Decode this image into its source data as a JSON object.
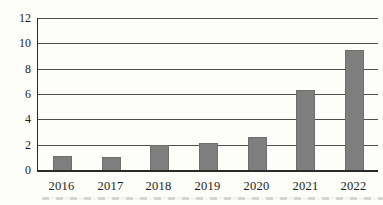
{
  "chart_data": {
    "type": "bar",
    "title": "",
    "xlabel": "",
    "ylabel": "",
    "categories": [
      "2016",
      "2017",
      "2018",
      "2019",
      "2020",
      "2021",
      "2022"
    ],
    "values": [
      1.1,
      1.0,
      2.0,
      2.1,
      2.6,
      6.3,
      9.5
    ],
    "ylim": [
      0,
      12
    ],
    "yticks": [
      0,
      2,
      4,
      6,
      8,
      10,
      12
    ],
    "grid": "horizontal",
    "legend": "none",
    "colors": {
      "background": "#fdfdfa",
      "bar_fill": "#7e7e7e",
      "bar_border": "#6e6e6e",
      "gridline": "#4f4f4f",
      "axis": "#2a2a2a",
      "text": "#1c1c1c"
    }
  }
}
